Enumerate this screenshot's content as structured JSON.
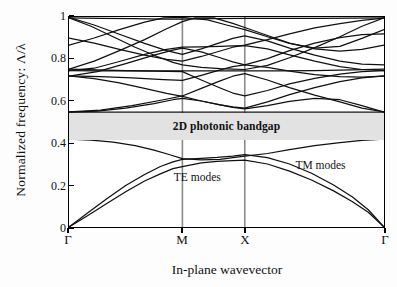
{
  "figure": {
    "ylabel": "Normalized frequency: Λ/λ",
    "xlabel": "In-plane wavevector",
    "gap_label": "2D photonic bandgap",
    "te_label": "TE modes",
    "tm_label": "TM modes",
    "gap_color": "#e2e2e2",
    "line_color": "#101010",
    "frame_color": "#000000",
    "grid_color": "#8a8a8a"
  },
  "axes": {
    "y_ticks": [
      "0",
      "0.2",
      "0.4",
      "0.6",
      "0.8",
      "1"
    ],
    "y_tick_values": [
      0,
      0.2,
      0.4,
      0.6,
      0.8,
      1
    ],
    "x_ticks": [
      "Γ",
      "M",
      "X",
      "Γ"
    ],
    "x_tick_positions": [
      0,
      0.36,
      0.558,
      1
    ],
    "ylim": [
      0,
      1
    ],
    "xlim": [
      0,
      1
    ]
  },
  "chart_data": {
    "type": "line",
    "title": "",
    "xlabel": "In-plane wavevector",
    "ylabel": "Normalized frequency: Λ/λ",
    "ylim": [
      0,
      1
    ],
    "xlim": [
      0,
      1
    ],
    "grid": "vertical-only",
    "legend": "inline-annotations",
    "x_symmetry_points": [
      {
        "label": "Γ",
        "x": 0
      },
      {
        "label": "M",
        "x": 0.36
      },
      {
        "label": "X",
        "x": 0.558
      },
      {
        "label": "Γ",
        "x": 1
      }
    ],
    "bandgap": {
      "label": "2D photonic bandgap",
      "ymin": 0.418,
      "ymax": 0.548
    },
    "annotations": [
      {
        "text": "TE modes",
        "x": 0.4,
        "y": 0.245
      },
      {
        "text": "TM modes",
        "x": 0.79,
        "y": 0.3
      }
    ],
    "series": [
      {
        "name": "TE band 1",
        "points": [
          [
            0,
            0.0
          ],
          [
            0.06,
            0.055
          ],
          [
            0.12,
            0.112
          ],
          [
            0.18,
            0.168
          ],
          [
            0.24,
            0.219
          ],
          [
            0.29,
            0.253
          ],
          [
            0.33,
            0.278
          ],
          [
            0.36,
            0.288
          ],
          [
            0.42,
            0.305
          ],
          [
            0.47,
            0.312
          ],
          [
            0.52,
            0.316
          ],
          [
            0.558,
            0.318
          ],
          [
            0.63,
            0.3
          ],
          [
            0.7,
            0.266
          ],
          [
            0.77,
            0.224
          ],
          [
            0.84,
            0.172
          ],
          [
            0.9,
            0.12
          ],
          [
            0.95,
            0.07
          ],
          [
            1,
            0.0
          ]
        ]
      },
      {
        "name": "TE band 2",
        "points": [
          [
            0,
            0.0
          ],
          [
            0.06,
            0.068
          ],
          [
            0.12,
            0.135
          ],
          [
            0.18,
            0.198
          ],
          [
            0.24,
            0.25
          ],
          [
            0.29,
            0.288
          ],
          [
            0.33,
            0.31
          ],
          [
            0.36,
            0.322
          ],
          [
            0.42,
            0.327
          ],
          [
            0.47,
            0.331
          ],
          [
            0.52,
            0.338
          ],
          [
            0.558,
            0.345
          ],
          [
            0.63,
            0.33
          ],
          [
            0.7,
            0.3
          ],
          [
            0.77,
            0.256
          ],
          [
            0.84,
            0.2
          ],
          [
            0.9,
            0.143
          ],
          [
            0.95,
            0.082
          ],
          [
            1,
            0.0
          ]
        ]
      },
      {
        "name": "TM band 1",
        "points": [
          [
            0,
            0.418
          ],
          [
            0.07,
            0.414
          ],
          [
            0.14,
            0.404
          ],
          [
            0.21,
            0.388
          ],
          [
            0.27,
            0.366
          ],
          [
            0.32,
            0.344
          ],
          [
            0.36,
            0.326
          ],
          [
            0.42,
            0.32
          ],
          [
            0.48,
            0.322
          ],
          [
            0.52,
            0.33
          ],
          [
            0.558,
            0.338
          ],
          [
            0.63,
            0.35
          ],
          [
            0.7,
            0.368
          ],
          [
            0.78,
            0.388
          ],
          [
            0.86,
            0.402
          ],
          [
            0.93,
            0.412
          ],
          [
            1,
            0.418
          ]
        ]
      },
      {
        "name": "Flat band 0.545",
        "points": [
          [
            0,
            0.547
          ],
          [
            0.18,
            0.547
          ],
          [
            0.36,
            0.547
          ],
          [
            0.558,
            0.547
          ],
          [
            0.78,
            0.547
          ],
          [
            1,
            0.547
          ]
        ]
      },
      {
        "name": "Band A",
        "points": [
          [
            0,
            0.547
          ],
          [
            0.09,
            0.552
          ],
          [
            0.18,
            0.566
          ],
          [
            0.27,
            0.588
          ],
          [
            0.33,
            0.606
          ],
          [
            0.36,
            0.613
          ],
          [
            0.42,
            0.6
          ],
          [
            0.48,
            0.582
          ],
          [
            0.52,
            0.57
          ],
          [
            0.558,
            0.562
          ],
          [
            0.63,
            0.578
          ],
          [
            0.7,
            0.598
          ],
          [
            0.78,
            0.612
          ],
          [
            0.86,
            0.606
          ],
          [
            0.93,
            0.578
          ],
          [
            1,
            0.547
          ]
        ]
      },
      {
        "name": "Band B",
        "points": [
          [
            0,
            0.72
          ],
          [
            0.08,
            0.706
          ],
          [
            0.16,
            0.686
          ],
          [
            0.24,
            0.66
          ],
          [
            0.31,
            0.636
          ],
          [
            0.36,
            0.622
          ],
          [
            0.42,
            0.6
          ],
          [
            0.48,
            0.582
          ],
          [
            0.52,
            0.572
          ],
          [
            0.558,
            0.566
          ],
          [
            0.63,
            0.596
          ],
          [
            0.7,
            0.63
          ],
          [
            0.78,
            0.664
          ],
          [
            0.86,
            0.692
          ],
          [
            0.93,
            0.71
          ],
          [
            1,
            0.72
          ]
        ]
      },
      {
        "name": "Band C",
        "points": [
          [
            0,
            0.745
          ],
          [
            0.09,
            0.744
          ],
          [
            0.18,
            0.743
          ],
          [
            0.27,
            0.742
          ],
          [
            0.36,
            0.74
          ],
          [
            0.42,
            0.7
          ],
          [
            0.48,
            0.662
          ],
          [
            0.52,
            0.638
          ],
          [
            0.558,
            0.624
          ],
          [
            0.63,
            0.65
          ],
          [
            0.7,
            0.682
          ],
          [
            0.78,
            0.708
          ],
          [
            0.86,
            0.728
          ],
          [
            0.93,
            0.74
          ],
          [
            1,
            0.745
          ]
        ]
      },
      {
        "name": "Band D",
        "points": [
          [
            0,
            0.752
          ],
          [
            0.09,
            0.748
          ],
          [
            0.18,
            0.745
          ],
          [
            0.27,
            0.744
          ],
          [
            0.36,
            0.744
          ],
          [
            0.45,
            0.744
          ],
          [
            0.558,
            0.744
          ],
          [
            0.66,
            0.744
          ],
          [
            0.78,
            0.745
          ],
          [
            0.9,
            0.748
          ],
          [
            1,
            0.752
          ]
        ]
      },
      {
        "name": "Band E",
        "points": [
          [
            0,
            0.745
          ],
          [
            0.08,
            0.756
          ],
          [
            0.16,
            0.788
          ],
          [
            0.24,
            0.822
          ],
          [
            0.31,
            0.846
          ],
          [
            0.36,
            0.856
          ],
          [
            0.42,
            0.858
          ],
          [
            0.48,
            0.86
          ],
          [
            0.52,
            0.862
          ],
          [
            0.558,
            0.864
          ],
          [
            0.63,
            0.848
          ],
          [
            0.7,
            0.82
          ],
          [
            0.78,
            0.79
          ],
          [
            0.86,
            0.764
          ],
          [
            0.93,
            0.75
          ],
          [
            1,
            0.745
          ]
        ]
      },
      {
        "name": "Band F",
        "points": [
          [
            0,
            0.718
          ],
          [
            0.09,
            0.74
          ],
          [
            0.18,
            0.778
          ],
          [
            0.27,
            0.818
          ],
          [
            0.33,
            0.842
          ],
          [
            0.36,
            0.852
          ],
          [
            0.42,
            0.834
          ],
          [
            0.48,
            0.806
          ],
          [
            0.52,
            0.786
          ],
          [
            0.558,
            0.772
          ],
          [
            0.63,
            0.802
          ],
          [
            0.7,
            0.84
          ],
          [
            0.78,
            0.876
          ],
          [
            0.86,
            0.902
          ],
          [
            0.93,
            0.916
          ],
          [
            1,
            0.92
          ]
        ]
      },
      {
        "name": "Band G",
        "points": [
          [
            0,
            0.9
          ],
          [
            0.08,
            0.876
          ],
          [
            0.16,
            0.846
          ],
          [
            0.24,
            0.818
          ],
          [
            0.31,
            0.798
          ],
          [
            0.36,
            0.79
          ],
          [
            0.42,
            0.812
          ],
          [
            0.48,
            0.838
          ],
          [
            0.52,
            0.856
          ],
          [
            0.558,
            0.866
          ],
          [
            0.63,
            0.892
          ],
          [
            0.7,
            0.92
          ],
          [
            0.78,
            0.948
          ],
          [
            0.86,
            0.968
          ],
          [
            0.93,
            0.984
          ],
          [
            1,
            0.995
          ]
        ]
      },
      {
        "name": "Band H",
        "points": [
          [
            0,
            0.998
          ],
          [
            0.08,
            0.962
          ],
          [
            0.16,
            0.918
          ],
          [
            0.24,
            0.874
          ],
          [
            0.31,
            0.84
          ],
          [
            0.36,
            0.822
          ],
          [
            0.42,
            0.848
          ],
          [
            0.48,
            0.878
          ],
          [
            0.52,
            0.898
          ],
          [
            0.558,
            0.91
          ],
          [
            0.63,
            0.886
          ],
          [
            0.7,
            0.852
          ],
          [
            0.78,
            0.818
          ],
          [
            0.86,
            0.79
          ],
          [
            0.93,
            0.776
          ],
          [
            1,
            0.772
          ]
        ]
      },
      {
        "name": "Band I",
        "points": [
          [
            0,
            0.996
          ],
          [
            0.1,
            0.994
          ],
          [
            0.2,
            0.992
          ],
          [
            0.3,
            0.99
          ],
          [
            0.36,
            0.99
          ],
          [
            0.45,
            0.992
          ],
          [
            0.558,
            0.994
          ],
          [
            0.68,
            0.994
          ],
          [
            0.8,
            0.994
          ],
          [
            0.9,
            0.995
          ],
          [
            1,
            0.996
          ]
        ]
      },
      {
        "name": "Band J",
        "points": [
          [
            0,
            0.752
          ],
          [
            0.08,
            0.79
          ],
          [
            0.16,
            0.84
          ],
          [
            0.24,
            0.892
          ],
          [
            0.31,
            0.944
          ],
          [
            0.36,
            0.978
          ],
          [
            0.4,
            0.996
          ],
          [
            0.46,
            0.996
          ],
          [
            0.52,
            0.97
          ],
          [
            0.558,
            0.95
          ],
          [
            0.63,
            0.912
          ],
          [
            0.7,
            0.876
          ],
          [
            0.78,
            0.848
          ],
          [
            0.86,
            0.838
          ],
          [
            0.93,
            0.846
          ],
          [
            1,
            0.866
          ]
        ]
      },
      {
        "name": "Band K",
        "points": [
          [
            0,
            0.866
          ],
          [
            0.08,
            0.9
          ],
          [
            0.16,
            0.94
          ],
          [
            0.24,
            0.976
          ],
          [
            0.3,
            0.996
          ],
          [
            0.36,
            0.998
          ],
          [
            0.44,
            0.986
          ],
          [
            0.5,
            0.962
          ],
          [
            0.558,
            0.94
          ],
          [
            0.63,
            0.906
          ],
          [
            0.7,
            0.874
          ],
          [
            0.78,
            0.852
          ],
          [
            0.86,
            0.86
          ],
          [
            0.93,
            0.898
          ],
          [
            1,
            0.94
          ]
        ]
      },
      {
        "name": "Band L",
        "points": [
          [
            0,
            0.548
          ],
          [
            0.1,
            0.556
          ],
          [
            0.2,
            0.578
          ],
          [
            0.3,
            0.606
          ],
          [
            0.36,
            0.624
          ],
          [
            0.42,
            0.66
          ],
          [
            0.48,
            0.696
          ],
          [
            0.52,
            0.718
          ],
          [
            0.558,
            0.73
          ],
          [
            0.63,
            0.7
          ],
          [
            0.7,
            0.664
          ],
          [
            0.78,
            0.628
          ],
          [
            0.86,
            0.596
          ],
          [
            0.93,
            0.566
          ],
          [
            1,
            0.548
          ]
        ]
      },
      {
        "name": "Band M",
        "points": [
          [
            0,
            0.72
          ],
          [
            0.1,
            0.716
          ],
          [
            0.2,
            0.71
          ],
          [
            0.3,
            0.702
          ],
          [
            0.36,
            0.698
          ],
          [
            0.42,
            0.722
          ],
          [
            0.48,
            0.748
          ],
          [
            0.52,
            0.764
          ],
          [
            0.558,
            0.772
          ],
          [
            0.63,
            0.76
          ],
          [
            0.7,
            0.742
          ],
          [
            0.78,
            0.726
          ],
          [
            0.86,
            0.716
          ],
          [
            0.93,
            0.714
          ],
          [
            1,
            0.718
          ]
        ]
      },
      {
        "name": "Band N",
        "points": [
          [
            0,
            0.996
          ],
          [
            0.07,
            0.956
          ],
          [
            0.14,
            0.906
          ],
          [
            0.21,
            0.856
          ],
          [
            0.28,
            0.812
          ],
          [
            0.33,
            0.784
          ],
          [
            0.36,
            0.772
          ],
          [
            0.42,
            0.76
          ],
          [
            0.48,
            0.754
          ],
          [
            0.52,
            0.752
          ],
          [
            0.558,
            0.75
          ],
          [
            0.63,
            0.77
          ],
          [
            0.7,
            0.806
          ],
          [
            0.78,
            0.854
          ],
          [
            0.86,
            0.906
          ],
          [
            0.93,
            0.956
          ],
          [
            1,
            0.996
          ]
        ]
      }
    ]
  }
}
